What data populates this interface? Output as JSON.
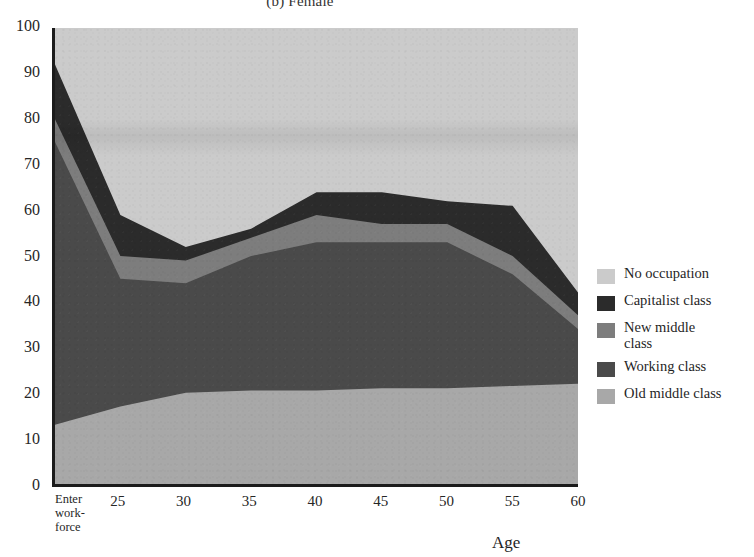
{
  "chart_data": {
    "type": "area",
    "title": "(b) Female",
    "xlabel": "Age",
    "ylabel": "",
    "ylim": [
      0,
      100
    ],
    "yticks": [
      0,
      10,
      20,
      30,
      40,
      50,
      60,
      70,
      80,
      90,
      100
    ],
    "categories": [
      "Enter work-force",
      "25",
      "30",
      "35",
      "40",
      "45",
      "50",
      "55",
      "60"
    ],
    "x_positions": [
      0,
      1,
      2,
      3,
      4,
      5,
      6,
      7,
      8
    ],
    "stacked": true,
    "stack_order_bottom_to_top": [
      "Old middle class",
      "Working class",
      "New middle class",
      "Capitalist class",
      "No occupation"
    ],
    "grid": false,
    "legend_position": "right",
    "series": [
      {
        "name": "Old middle class",
        "color": "#a8a8a8",
        "values": [
          13,
          17,
          20,
          20.5,
          20.5,
          21,
          21,
          21.5,
          22
        ],
        "cumulative_top": [
          13,
          17,
          20,
          20.5,
          20.5,
          21,
          21,
          21.5,
          22
        ]
      },
      {
        "name": "Working class",
        "color": "#4a4a4a",
        "values": [
          62,
          28,
          24,
          29.5,
          32.5,
          32,
          32,
          24.5,
          12
        ],
        "cumulative_top": [
          75,
          45,
          44,
          50,
          53,
          53,
          53,
          46,
          34
        ]
      },
      {
        "name": "New middle class",
        "color": "#7d7d7d",
        "values": [
          5,
          5,
          5,
          4,
          6,
          4,
          4,
          4,
          3
        ],
        "cumulative_top": [
          80,
          50,
          49,
          54,
          59,
          57,
          57,
          50,
          37
        ]
      },
      {
        "name": "Capitalist class",
        "color": "#2b2b2b",
        "values": [
          12,
          9,
          3,
          2,
          5,
          7,
          5,
          11,
          5
        ],
        "cumulative_top": [
          92,
          59,
          52,
          56,
          64,
          64,
          62,
          61,
          42
        ]
      },
      {
        "name": "No occupation",
        "color": "#cbcbcb",
        "values": [
          8,
          41,
          48,
          44,
          36,
          36,
          38,
          39,
          58
        ],
        "cumulative_top": [
          100,
          100,
          100,
          100,
          100,
          100,
          100,
          100,
          100
        ]
      }
    ]
  },
  "legend": {
    "items": [
      {
        "label": "No occupation",
        "color": "#cbcbcb"
      },
      {
        "label": "Capitalist class",
        "color": "#2b2b2b"
      },
      {
        "label": "New middle\nclass",
        "color": "#7d7d7d"
      },
      {
        "label": "Working class",
        "color": "#4a4a4a"
      },
      {
        "label": "Old middle class",
        "color": "#a8a8a8"
      }
    ]
  },
  "axes": {
    "y_tick_labels": [
      "100",
      "90",
      "80",
      "70",
      "60",
      "50",
      "40",
      "30",
      "20",
      "10",
      "0"
    ],
    "x_tick_labels": [
      "Enter work-force",
      "25",
      "30",
      "35",
      "40",
      "45",
      "50",
      "55",
      "60"
    ],
    "x_axis_title": "Age"
  },
  "colors": {
    "axis": "#1b1b1b",
    "text": "#1f1f1f",
    "background": "#ffffff"
  }
}
